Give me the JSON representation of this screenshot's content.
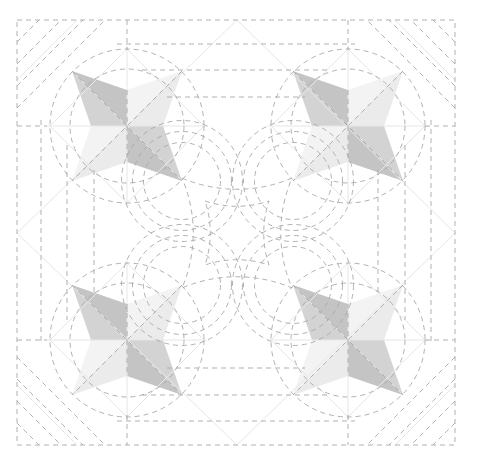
{
  "diagram": {
    "type": "quilting-pattern",
    "canvas": {
      "width": 477,
      "height": 453
    },
    "border": {
      "x": 17,
      "y": 20,
      "width": 438,
      "height": 425
    },
    "colors": {
      "background": "#ffffff",
      "dashed_stitch": "#a8a8a8",
      "construction_line": "#e6e6e6",
      "dark_patch": "#c4c4c4",
      "medium_patch": "#d3d3d3",
      "light_patch": "#ebebeb",
      "lighter_patch": "#f3f3f3"
    },
    "stars": [
      {
        "name": "star-top-left",
        "cx": 127,
        "cy": 126
      },
      {
        "name": "star-top-right",
        "cx": 348,
        "cy": 126
      },
      {
        "name": "star-bottom-left",
        "cx": 127,
        "cy": 340
      },
      {
        "name": "star-bottom-right",
        "cx": 348,
        "cy": 340
      }
    ],
    "star_geometry": {
      "tip_offset": 55,
      "inner_offset": 36
    },
    "circles": {
      "outer_radius": 77,
      "inner_radius": 57
    },
    "center": {
      "cx": 237,
      "cy": 233
    }
  }
}
